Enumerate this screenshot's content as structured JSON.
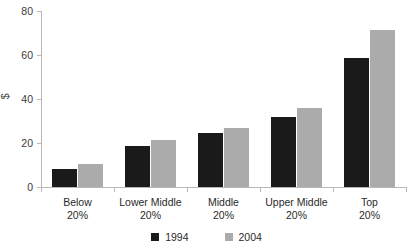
{
  "chart_data": {
    "type": "bar",
    "title": "",
    "xlabel": "",
    "ylabel": "$",
    "ylim": [
      0,
      80
    ],
    "ytick_values": [
      0,
      20,
      40,
      60,
      80
    ],
    "ytick_labels": [
      "0",
      "20",
      "40",
      "60",
      "80"
    ],
    "grid": false,
    "legend_position": "bottom-center",
    "categories": [
      "Below 20%",
      "Lower Middle 20%",
      "Middle 20%",
      "Upper Middle 20%",
      "Top 20%"
    ],
    "category_lines": [
      [
        "Below",
        "20%"
      ],
      [
        "Lower Middle",
        "20%"
      ],
      [
        "Middle",
        "20%"
      ],
      [
        "Upper Middle",
        "20%"
      ],
      [
        "Top",
        "20%"
      ]
    ],
    "series": [
      {
        "name": "1994",
        "color": "#1a1a1a",
        "values": [
          8,
          18.5,
          24.5,
          32,
          58.5
        ]
      },
      {
        "name": "2004",
        "color": "#ababab",
        "values": [
          10.5,
          21.5,
          27,
          36,
          71.5
        ]
      }
    ]
  },
  "axis": {
    "y_title": "$",
    "axis_color": "#b8b8b8"
  },
  "legend": {
    "entries": [
      {
        "label": "1994",
        "series": "s1"
      },
      {
        "label": "2004",
        "series": "s2"
      }
    ]
  }
}
